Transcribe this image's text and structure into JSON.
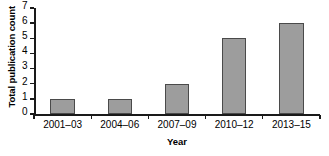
{
  "chart_data": {
    "type": "bar",
    "title": "",
    "categories": [
      "2001–03",
      "2004–06",
      "2007–09",
      "2010–12",
      "2013–15"
    ],
    "values": [
      1,
      1,
      2,
      5,
      6
    ],
    "xlabel": "Year",
    "ylabel": "Total publication count",
    "ylim": [
      0,
      7
    ],
    "yticks": [
      0,
      1,
      2,
      3,
      4,
      5,
      6,
      7
    ],
    "ytick_labels": [
      "0",
      "1",
      "2",
      "3",
      "4",
      "5",
      "6",
      "7"
    ],
    "grid": false,
    "legend": null,
    "bar_color": "#9d9d9d",
    "bar_edge_color": "#4a4a4a",
    "axis_color": "#1a1a1a"
  }
}
